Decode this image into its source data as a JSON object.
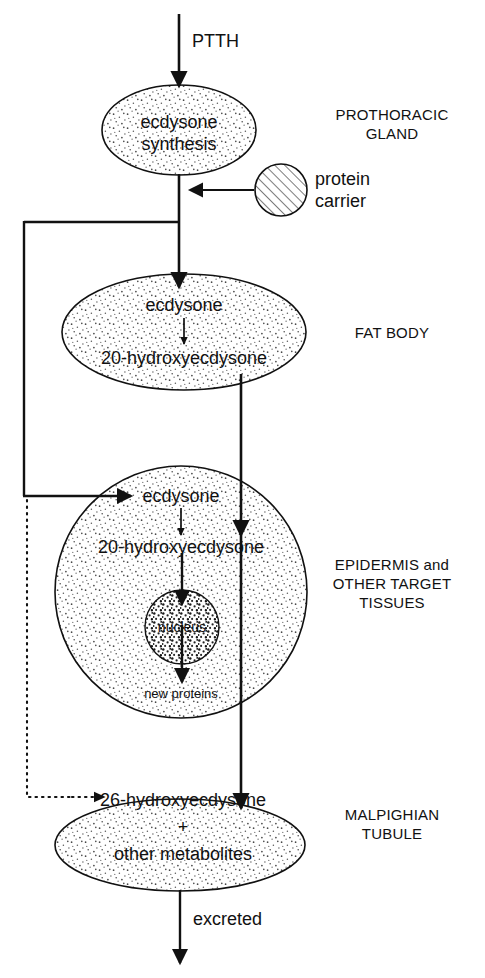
{
  "diagram": {
    "type": "flow-diagram",
    "background_color": "#ffffff",
    "line_color": "#111111",
    "stipple_color": "#555555"
  },
  "nodes": {
    "prothoracic_gland": {
      "shape": "ellipse",
      "fill": "stipple-light",
      "line1": "ecdysone",
      "line2": "synthesis"
    },
    "protein_carrier": {
      "shape": "circle",
      "fill": "diagonal-hatch",
      "label_line1": "protein",
      "label_line2": "carrier"
    },
    "fat_body": {
      "shape": "ellipse",
      "fill": "stipple-light",
      "line1": "ecdysone",
      "line2": "20-hydroxyecdysone"
    },
    "epidermis": {
      "shape": "circle",
      "fill": "stipple-light",
      "line1": "ecdysone",
      "line2": "20-hydroxyecdysone",
      "line3": "new proteins"
    },
    "nucleus": {
      "shape": "circle",
      "fill": "stipple-coarse",
      "label": "nucleus"
    },
    "malpighian": {
      "shape": "ellipse",
      "fill": "stipple-light",
      "line1": "26-hydroxyecdysone",
      "line2": "+",
      "line3": "other metabolites"
    }
  },
  "edge_labels": {
    "ptth": "PTTH",
    "excreted": "excreted"
  },
  "region_labels": {
    "prothoracic_gland_l1": "PROTHORACIC",
    "prothoracic_gland_l2": "GLAND",
    "fat_body": "FAT BODY",
    "epidermis_l1": "EPIDERMIS and",
    "epidermis_l2": "OTHER TARGET",
    "epidermis_l3": "TISSUES",
    "malpighian_l1": "MALPIGHIAN",
    "malpighian_l2": "TUBULE"
  }
}
